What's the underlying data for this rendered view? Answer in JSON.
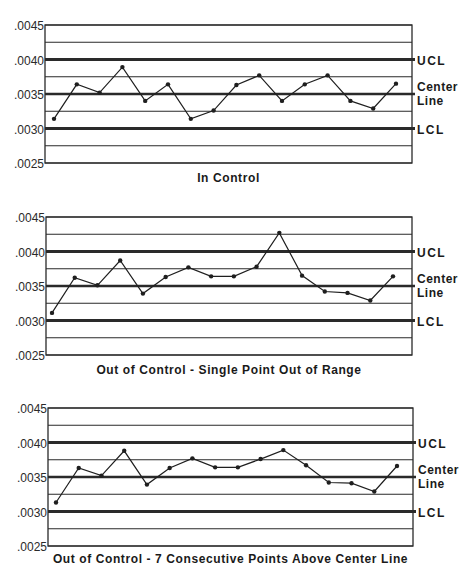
{
  "colors": {
    "line": "#1f1f1f",
    "grid": "#2a2a2a",
    "background": "#ffffff"
  },
  "labels": {
    "ucl": "UCL",
    "center_line_1": "Center",
    "center_line_2": "Line",
    "lcl": "LCL"
  },
  "chart_data": [
    {
      "type": "line",
      "title": "In Control",
      "xlabel": "",
      "ylabel": "",
      "yticks": [
        ".0045",
        ".0040",
        ".0035",
        ".0030",
        ".0025"
      ],
      "ylim": [
        0.0025,
        0.0045
      ],
      "grid": true,
      "gridlines": [
        0.0045,
        0.00425,
        0.004,
        0.00375,
        0.0035,
        0.00325,
        0.003,
        0.00275,
        0.0025
      ],
      "ucl": 0.004,
      "center_line": 0.0035,
      "lcl": 0.003,
      "x": [
        1,
        2,
        3,
        4,
        5,
        6,
        7,
        8,
        9,
        10,
        11,
        12,
        13,
        14,
        15,
        16
      ],
      "series": [
        {
          "name": "Measurement",
          "values": [
            0.00314,
            0.00364,
            0.00352,
            0.00389,
            0.0034,
            0.00364,
            0.00314,
            0.00326,
            0.00363,
            0.00377,
            0.0034,
            0.00364,
            0.00377,
            0.0034,
            0.00329,
            0.00365
          ]
        }
      ]
    },
    {
      "type": "line",
      "title": "Out of Control - Single Point Out of Range",
      "xlabel": "",
      "ylabel": "",
      "yticks": [
        ".0045",
        ".0040",
        ".0035",
        ".0030",
        ".0025"
      ],
      "ylim": [
        0.0025,
        0.0045
      ],
      "grid": true,
      "gridlines": [
        0.0045,
        0.00425,
        0.004,
        0.00375,
        0.0035,
        0.00325,
        0.003,
        0.00275,
        0.0025
      ],
      "ucl": 0.004,
      "center_line": 0.0035,
      "lcl": 0.003,
      "x": [
        1,
        2,
        3,
        4,
        5,
        6,
        7,
        8,
        9,
        10,
        11,
        12,
        13,
        14,
        15,
        16
      ],
      "series": [
        {
          "name": "Measurement",
          "values": [
            0.00311,
            0.00362,
            0.00351,
            0.00387,
            0.00339,
            0.00363,
            0.00377,
            0.00364,
            0.00364,
            0.00378,
            0.00427,
            0.00365,
            0.00342,
            0.0034,
            0.00329,
            0.00364
          ]
        }
      ]
    },
    {
      "type": "line",
      "title": "Out of Control - 7 Consecutive Points Above Center Line",
      "xlabel": "",
      "ylabel": "",
      "yticks": [
        ".0045",
        ".0040",
        ".0035",
        ".0030",
        ".0025"
      ],
      "ylim": [
        0.0025,
        0.0045
      ],
      "grid": true,
      "gridlines": [
        0.0045,
        0.00425,
        0.004,
        0.00375,
        0.0035,
        0.00325,
        0.003,
        0.00275,
        0.0025
      ],
      "ucl": 0.004,
      "center_line": 0.0035,
      "lcl": 0.003,
      "x": [
        1,
        2,
        3,
        4,
        5,
        6,
        7,
        8,
        9,
        10,
        11,
        12,
        13,
        14,
        15,
        16
      ],
      "series": [
        {
          "name": "Measurement",
          "values": [
            0.00313,
            0.00363,
            0.00352,
            0.00388,
            0.00339,
            0.00363,
            0.00377,
            0.00364,
            0.00364,
            0.00376,
            0.00389,
            0.00367,
            0.00342,
            0.00341,
            0.00329,
            0.00366
          ]
        }
      ]
    }
  ],
  "layout": {
    "panels": [
      {
        "left": 45,
        "right": 412,
        "top": 25,
        "bottom": 163,
        "x_first": 54,
        "x_last": 396,
        "title_y": 182
      },
      {
        "left": 46,
        "right": 412,
        "top": 217,
        "bottom": 355,
        "x_first": 52,
        "x_last": 393,
        "title_y": 374
      },
      {
        "left": 48,
        "right": 413,
        "top": 408,
        "bottom": 546,
        "x_first": 56,
        "x_last": 397,
        "title_y": 563
      }
    ]
  }
}
